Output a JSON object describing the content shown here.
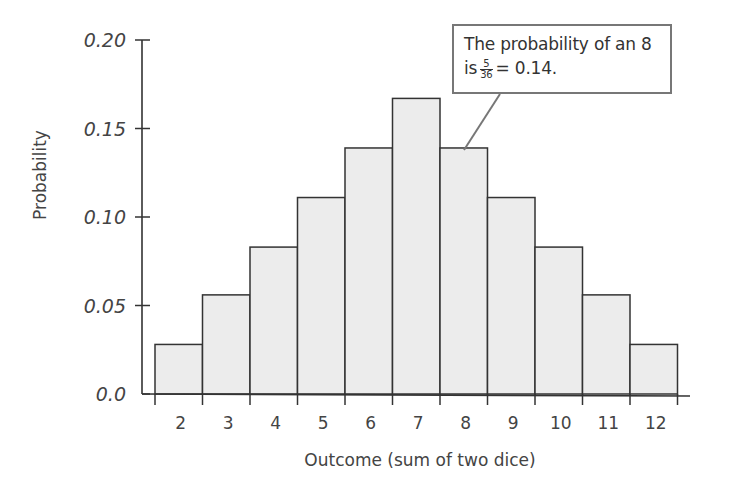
{
  "chart_data": {
    "type": "bar",
    "title": "",
    "xlabel": "Outcome (sum of two dice)",
    "ylabel": "Probability",
    "categories": [
      "2",
      "3",
      "4",
      "5",
      "6",
      "7",
      "8",
      "9",
      "10",
      "11",
      "12"
    ],
    "values": [
      0.028,
      0.056,
      0.083,
      0.111,
      0.139,
      0.167,
      0.139,
      0.111,
      0.083,
      0.056,
      0.028
    ],
    "exact_fractions": [
      "1/36",
      "2/36",
      "3/36",
      "4/36",
      "5/36",
      "6/36",
      "5/36",
      "4/36",
      "3/36",
      "2/36",
      "1/36"
    ],
    "yticks": [
      "0.0",
      "0.05",
      "0.10",
      "0.15",
      "0.20"
    ],
    "ylim": [
      0,
      0.2
    ],
    "grid": false,
    "legend": null,
    "bar_fill": "#ececec",
    "bar_stroke": "#333333",
    "annotation": {
      "line1": "The probability of an 8",
      "prefix": "is",
      "fraction_num": "5",
      "fraction_den": "36",
      "suffix": "= 0.14.",
      "points_to": "8"
    }
  }
}
